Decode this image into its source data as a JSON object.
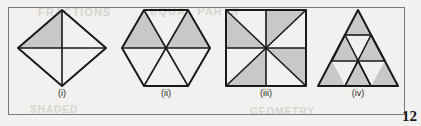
{
  "page": {
    "page_number": "12",
    "background_color": "#f2f1ef",
    "border_color": "#7a7a7a",
    "shade_color": "#c8c8c8",
    "stroke_color": "#1a1a1a",
    "bleed_text": [
      "FRACTIONS",
      "EQUAL PARTS",
      "SHADED",
      "GEOMETRY"
    ]
  },
  "figures": [
    {
      "id": "figure-i",
      "label": "(i)",
      "shape": "rhombus",
      "total_parts": 4,
      "shaded_parts": 1,
      "fraction_shaded": "1/4",
      "description": "Rhombus divided by its two diagonals into four triangles; the top-left triangle is shaded.",
      "outline_points": "48,4 92,42 48,80 4,42",
      "divider_lines": [
        {
          "x1": 4,
          "y1": 42,
          "x2": 92,
          "y2": 42
        },
        {
          "x1": 48,
          "y1": 4,
          "x2": 48,
          "y2": 80
        }
      ],
      "parts": [
        {
          "name": "top-left",
          "points": "48,4 48,42 4,42",
          "shaded": true
        },
        {
          "name": "top-right",
          "points": "48,4 92,42 48,42",
          "shaded": false
        },
        {
          "name": "bottom-right",
          "points": "48,42 92,42 48,80",
          "shaded": false
        },
        {
          "name": "bottom-left",
          "points": "48,42 48,80 4,42",
          "shaded": false
        }
      ]
    },
    {
      "id": "figure-ii",
      "label": "(ii)",
      "shape": "hexagon",
      "total_parts": 6,
      "shaded_parts": 2,
      "fraction_shaded": "1/3",
      "description": "Regular hexagon divided into six triangles from the centre; the upper-left and upper-right triangles are shaded.",
      "outline_points": "26,4 70,4 92,42 70,80 26,80 4,42",
      "divider_lines": [
        {
          "x1": 4,
          "y1": 42,
          "x2": 92,
          "y2": 42
        },
        {
          "x1": 26,
          "y1": 4,
          "x2": 70,
          "y2": 80
        },
        {
          "x1": 70,
          "y1": 4,
          "x2": 26,
          "y2": 80
        }
      ],
      "parts": [
        {
          "name": "top",
          "points": "26,4 70,4 48,42",
          "shaded": false
        },
        {
          "name": "upper-right",
          "points": "70,4 92,42 48,42",
          "shaded": true
        },
        {
          "name": "lower-right",
          "points": "92,42 70,80 48,42",
          "shaded": false
        },
        {
          "name": "bottom",
          "points": "70,80 26,80 48,42",
          "shaded": false
        },
        {
          "name": "lower-left",
          "points": "26,80 4,42 48,42",
          "shaded": false
        },
        {
          "name": "upper-left",
          "points": "4,42 26,4 48,42",
          "shaded": true
        }
      ]
    },
    {
      "id": "figure-iii",
      "label": "(iii)",
      "shape": "square",
      "total_parts": 8,
      "shaded_parts": 4,
      "fraction_shaded": "1/2",
      "description": "Square divided by both diagonals and both mid-lines into eight triangles, shaded in a pinwheel pattern.",
      "outline_points": "4,4 84,4 84,80 4,80",
      "divider_lines": [
        {
          "x1": 4,
          "y1": 42,
          "x2": 84,
          "y2": 42
        },
        {
          "x1": 44,
          "y1": 4,
          "x2": 44,
          "y2": 80
        },
        {
          "x1": 4,
          "y1": 4,
          "x2": 84,
          "y2": 80
        },
        {
          "x1": 84,
          "y1": 4,
          "x2": 4,
          "y2": 80
        }
      ],
      "parts": [
        {
          "name": "top-left-upper",
          "points": "4,4 44,4 44,42",
          "shaded": false
        },
        {
          "name": "top-left-lower",
          "points": "4,4 44,42 4,42",
          "shaded": true
        },
        {
          "name": "top-right-upper",
          "points": "44,4 84,4 44,42",
          "shaded": true
        },
        {
          "name": "top-right-lower",
          "points": "84,4 84,42 44,42",
          "shaded": false
        },
        {
          "name": "bottom-right-upper",
          "points": "84,42 84,80 44,42",
          "shaded": true
        },
        {
          "name": "bottom-right-lower",
          "points": "84,80 44,80 44,42",
          "shaded": false
        },
        {
          "name": "bottom-left-lower",
          "points": "44,80 4,80 44,42",
          "shaded": true
        },
        {
          "name": "bottom-left-upper",
          "points": "4,80 4,42 44,42",
          "shaded": false
        }
      ]
    },
    {
      "id": "figure-iv",
      "label": "(iv)",
      "shape": "triangle",
      "total_parts": 9,
      "shaded_parts": 6,
      "fraction_shaded": "2/3",
      "description": "Equilateral triangle divided into nine small triangles; the six upward-pointing triangles are shaded.",
      "outline_points": "44,4 84,80 4,80",
      "divider_lines": [
        {
          "x1": 31,
          "y1": 29,
          "x2": 57,
          "y2": 29
        },
        {
          "x1": 18,
          "y1": 55,
          "x2": 71,
          "y2": 55
        },
        {
          "x1": 31,
          "y1": 29,
          "x2": 18,
          "y2": 55
        },
        {
          "x1": 57,
          "y1": 29,
          "x2": 71,
          "y2": 55
        },
        {
          "x1": 44,
          "y1": 55,
          "x2": 31,
          "y2": 80
        },
        {
          "x1": 44,
          "y1": 55,
          "x2": 57,
          "y2": 80
        },
        {
          "x1": 31,
          "y1": 29,
          "x2": 57,
          "y2": 80
        },
        {
          "x1": 57,
          "y1": 29,
          "x2": 31,
          "y2": 80
        }
      ],
      "parts": [
        {
          "name": "row1-up-1",
          "points": "44,4 57,29 31,29",
          "shaded": true
        },
        {
          "name": "row2-up-1",
          "points": "31,29 44,55 18,55",
          "shaded": true
        },
        {
          "name": "row2-down-1",
          "points": "31,29 57,29 44,55",
          "shaded": false
        },
        {
          "name": "row2-up-2",
          "points": "57,29 71,55 44,55",
          "shaded": true
        },
        {
          "name": "row3-up-1",
          "points": "18,55 31,80 4,80",
          "shaded": true
        },
        {
          "name": "row3-down-1",
          "points": "18,55 44,55 31,80",
          "shaded": false
        },
        {
          "name": "row3-up-2",
          "points": "44,55 57,80 31,80",
          "shaded": true
        },
        {
          "name": "row3-down-2",
          "points": "44,55 71,55 57,80",
          "shaded": false
        },
        {
          "name": "row3-up-3",
          "points": "71,55 84,80 57,80",
          "shaded": true
        }
      ]
    }
  ]
}
